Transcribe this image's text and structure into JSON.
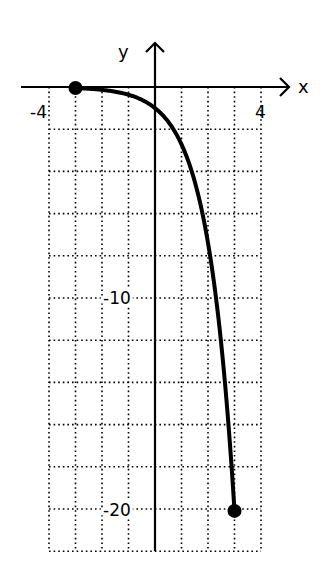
{
  "chart_data": {
    "type": "line",
    "title": "",
    "xlabel": "x",
    "ylabel": "y",
    "function": "y = -e^x",
    "domain": [
      -3,
      3
    ],
    "xlim": [
      -4,
      4
    ],
    "ylim": [
      -22,
      0
    ],
    "grid": true,
    "grid_step_x": 1,
    "grid_step_y": 2,
    "x_tick_labels": [
      {
        "value": -4,
        "label": "-4"
      },
      {
        "value": 4,
        "label": "4"
      }
    ],
    "y_tick_labels": [
      {
        "value": -10,
        "label": "-10"
      },
      {
        "value": -20,
        "label": "-20"
      }
    ],
    "endpoints": [
      {
        "x": -3,
        "y": -0.05,
        "style": "closed-dot"
      },
      {
        "x": 3,
        "y": -20.09,
        "style": "closed-dot"
      }
    ],
    "series": [
      {
        "name": "y = -e^x",
        "x": [
          -3,
          -2.5,
          -2,
          -1.5,
          -1,
          -0.5,
          0,
          0.5,
          1,
          1.5,
          2,
          2.5,
          3
        ],
        "values": [
          -0.05,
          -0.08,
          -0.14,
          -0.22,
          -0.37,
          -0.61,
          -1,
          -1.65,
          -2.72,
          -4.48,
          -7.39,
          -12.18,
          -20.09
        ]
      }
    ],
    "colors": {
      "curve": "#000000",
      "grid": "#000000",
      "background": "#ffffff"
    }
  },
  "labels": {
    "x_axis": "x",
    "y_axis": "y",
    "x_min": "-4",
    "x_max": "4",
    "y_mid": "-10",
    "y_min": "-20"
  }
}
